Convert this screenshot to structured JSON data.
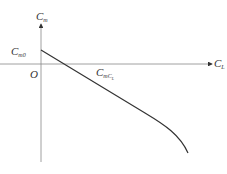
{
  "diagram": {
    "type": "pitching-moment-curve",
    "axes": {
      "y_label": {
        "base": "C",
        "sub": "m"
      },
      "x_label": {
        "base": "C",
        "sub": "L"
      },
      "origin_label": "O"
    },
    "annotations": {
      "intercept": {
        "base": "C",
        "sub": "m0"
      },
      "slope": {
        "base": "C",
        "sub": "mC",
        "subsub": "L"
      }
    },
    "caption": "",
    "colors": {
      "line": "#333333",
      "axis": "#888888",
      "text": "#333333"
    }
  }
}
